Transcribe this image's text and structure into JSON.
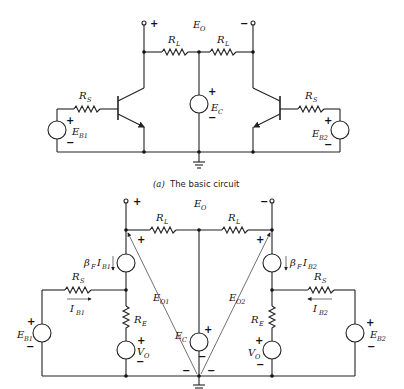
{
  "figure": {
    "caption_a": {
      "marker": "(a)",
      "text": "The basic circuit"
    },
    "circuit_a": {
      "output_label": "E_O",
      "output_plus": "+",
      "output_minus": "−",
      "load_resistor_left": "R_L",
      "load_resistor_right": "R_L",
      "supply": {
        "name": "E_C",
        "plus": "+",
        "minus": "−"
      },
      "source_resistor_left": "R_S",
      "source_resistor_right": "R_S",
      "input_source_left": {
        "name": "E_B1",
        "plus": "+",
        "minus": "−"
      },
      "input_source_right": {
        "name": "E_B2",
        "plus": "+",
        "minus": "−"
      },
      "transistors": [
        "Q1 (NPN, left)",
        "Q2 (NPN, right)"
      ]
    },
    "circuit_b": {
      "output_label": "E_O",
      "output_plus": "+",
      "output_minus": "−",
      "load_resistor_left": "R_L",
      "load_resistor_right": "R_L",
      "dependent_source_left": "β_F I_B1",
      "dependent_source_right": "β_F I_B2",
      "source_resistor_left": "R_S",
      "source_resistor_right": "R_S",
      "base_current_left": "I_B1",
      "base_current_right": "I_B2",
      "emitter_resistor_left": "R_E",
      "emitter_resistor_right": "R_E",
      "vo_source_left": {
        "name": "V_O",
        "plus": "+",
        "minus": "−"
      },
      "vo_source_right": {
        "name": "V_O",
        "plus": "+",
        "minus": "−"
      },
      "supply": {
        "name": "E_C",
        "plus": "+",
        "minus": "−"
      },
      "input_source_left": {
        "name": "E_B1",
        "plus": "+",
        "minus": "−"
      },
      "input_source_right": {
        "name": "E_B2",
        "plus": "+",
        "minus": "−"
      },
      "node_voltage_left": {
        "name": "E_O1",
        "plus": "+",
        "minus": "−"
      },
      "node_voltage_right": {
        "name": "E_O2",
        "plus": "+",
        "minus": "−"
      }
    },
    "labels": {
      "E": "E",
      "R": "R",
      "I": "I",
      "V": "V",
      "beta": "β",
      "sub_O": "O",
      "sub_L": "L",
      "sub_S": "S",
      "sub_C": "C",
      "sub_E": "E",
      "sub_F": "F",
      "sub_B1": "B1",
      "sub_B2": "B2",
      "sub_O1": "O1",
      "sub_O2": "O2",
      "plus": "+",
      "minus": "−"
    }
  }
}
